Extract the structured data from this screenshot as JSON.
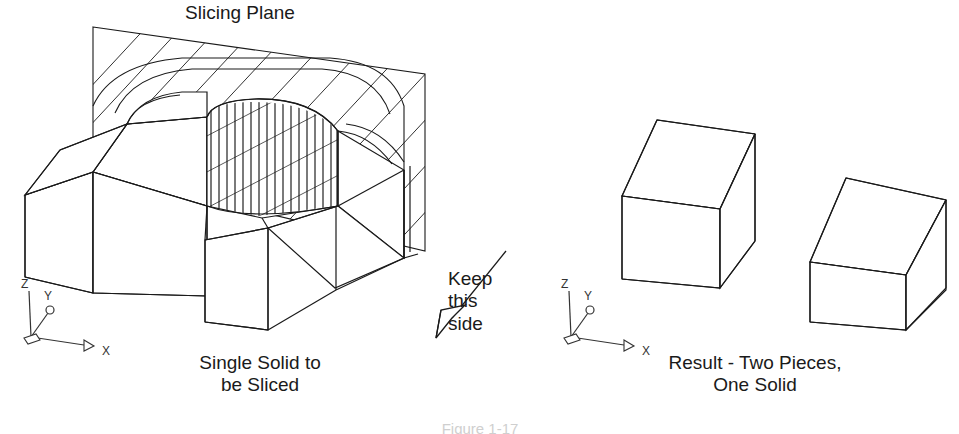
{
  "figure": {
    "title": "Slicing Plane",
    "caption": "Figure 1-17",
    "background_color": "#ffffff",
    "line_color": "#1a1a1a",
    "text_color": "#1a1a1a"
  },
  "labels": {
    "slicing_plane": "Slicing Plane",
    "single_solid": "Single Solid to\nbe Sliced",
    "keep_this_side": "Keep\nthis\nside",
    "result": "Result - Two Pieces,\nOne Solid"
  },
  "left_view": {
    "name": "single-solid-to-be-sliced",
    "description": "Isometric solid block with a rounded slot, intersected by a hatched slicing plane",
    "slicing_plane": {
      "hatch_angle_degrees": 45,
      "hatch_spacing_px": 22,
      "corners": [
        [
          93,
          27
        ],
        [
          425,
          74
        ],
        [
          425,
          251
        ],
        [
          93,
          172
        ]
      ]
    },
    "keep_side_arrow": {
      "from": [
        505,
        252
      ],
      "to": [
        437,
        338
      ],
      "style": "open-outline-arrowhead"
    }
  },
  "right_view": {
    "name": "result-two-pieces-one-solid",
    "description": "Two separate isometric boxes resulting from the slice",
    "pieces": 2
  },
  "axes": {
    "x_label": "X",
    "y_label": "Y",
    "z_label": "Z",
    "left_origin": [
      28,
      337
    ],
    "right_origin": [
      568,
      337
    ]
  }
}
